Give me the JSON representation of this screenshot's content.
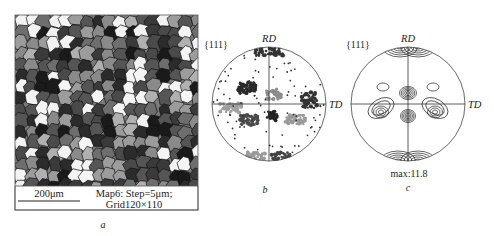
{
  "figure": {
    "panels": [
      {
        "id": "a",
        "caption": "a",
        "type": "ebsd-orientation-map",
        "scale_bar": "200μm",
        "map_info_line1": "Map6: Step=5μm;",
        "map_info_line2": "Grid120×110",
        "grain_colors": [
          "#1a1a1a",
          "#3a3a3a",
          "#555555",
          "#6e6e6e",
          "#8a8a8a",
          "#9c9c9c",
          "#b0b0b0",
          "#f2f2f2",
          "#4a4a4a",
          "#2b2b2b"
        ]
      },
      {
        "id": "b",
        "caption": "b",
        "type": "discrete-pole-figure",
        "plane": "{111}",
        "axis_top": "RD",
        "axis_right": "TD"
      },
      {
        "id": "c",
        "caption": "c",
        "type": "contour-pole-figure",
        "plane": "{111}",
        "axis_top": "RD",
        "axis_right": "TD",
        "max_label": "max:11.8"
      }
    ]
  }
}
